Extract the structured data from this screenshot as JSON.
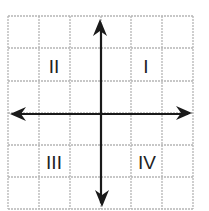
{
  "diagram": {
    "grid": {
      "columns": 6,
      "rows": 6,
      "line_color": "#b5b5b5",
      "axis_color": "#1a1a1a"
    },
    "quadrants": [
      {
        "id": "I",
        "label": "I"
      },
      {
        "id": "II",
        "label": "II"
      },
      {
        "id": "III",
        "label": "III"
      },
      {
        "id": "IV",
        "label": "IV"
      }
    ]
  }
}
